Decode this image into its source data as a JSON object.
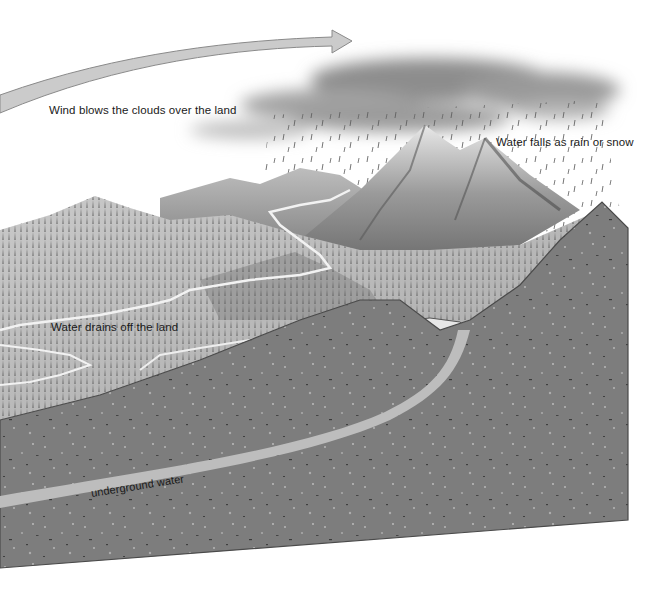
{
  "diagram": {
    "labels": {
      "wind": "Wind blows the clouds over the land",
      "precipitation": "Water falls as rain or snow",
      "runoff": "Water drains off the land",
      "groundwater": "underground water"
    },
    "colors": {
      "background": "#ffffff",
      "arrow_fill": "#c8c8c8",
      "arrow_stroke": "#8a8a8a",
      "cloud": "#8c8c8c",
      "ground_block": "#7d7d7d",
      "ground_edge": "#4a4a4a",
      "underground_water": "#bdbdbd",
      "mountain_light": "#d9d9d9",
      "mountain_dark": "#4f4f4f",
      "river": "#f2f2f2",
      "text": "#1a1a1a"
    }
  }
}
